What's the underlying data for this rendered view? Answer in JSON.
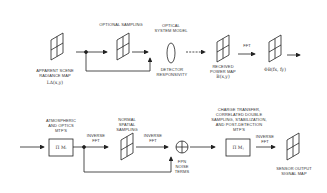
{
  "diagram": {
    "top_row": {
      "input_map": {
        "label": "APPARENT SCENE\nRADIANCE MAP",
        "symbol": "LΔ(x,y)"
      },
      "optional_sampling": {
        "label": "OPTIONAL SAMPLING"
      },
      "optical_model": {
        "label": "OPTICAL\nSYSTEM MODEL"
      },
      "detector": {
        "label": "DETECTOR\nRESPONSIVITY"
      },
      "received_map": {
        "label": "RECEIVED\nPOWER MAP",
        "symbol": "B(x,y)"
      },
      "fft_label": "FFT",
      "spectrum": {
        "symbol": "ΦB(fx, fy)"
      }
    },
    "bottom_row": {
      "atmos_mtf": {
        "label": "ATMOSPHERIC\nAND OPTICS\nMTF'S",
        "box_symbol": "Π Mᵢ"
      },
      "inverse_fft_1": "INVERSE\nFFT",
      "spatial_sampling": {
        "label": "NORMAL\nSPATIAL\nSAMPLING"
      },
      "inverse_fft_2": "INVERSE\nFFT",
      "fpn_noise": {
        "label": "FPN\nNOISE\nTERMS"
      },
      "post_mtf": {
        "label": "CHARGE TRANSFER,\nCORRELATED DOUBLE\nSAMPLING, STABILIZATION,\nAND POST-DETECTION\nMTF's",
        "box_symbol": "Π Mⱼ"
      },
      "inverse_fft_3": "INVERSE\nFFT",
      "output_map": {
        "label": "SENSOR OUTPUT\nSIGNAL MAP"
      }
    }
  }
}
